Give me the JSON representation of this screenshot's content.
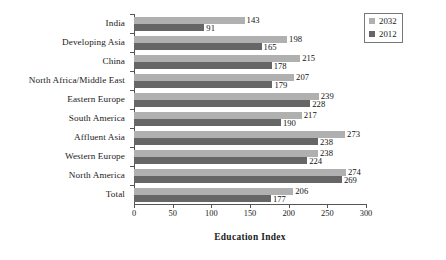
{
  "chart_data": {
    "type": "bar",
    "orientation": "horizontal",
    "title": "",
    "xlabel": "Education Index",
    "ylabel": "",
    "xlim": [
      0,
      300
    ],
    "xticks": [
      0,
      50,
      100,
      150,
      200,
      250,
      300
    ],
    "grid": false,
    "legend_position": "top-right",
    "categories": [
      "India",
      "Developing Asia",
      "China",
      "North Africa/Middle East",
      "Eastern Europe",
      "South America",
      "Affluent Asia",
      "Western Europe",
      "North America",
      "Total"
    ],
    "series": [
      {
        "name": "2032",
        "color": "#b0b0b0",
        "values": [
          143,
          198,
          215,
          207,
          239,
          217,
          273,
          238,
          274,
          206
        ]
      },
      {
        "name": "2012",
        "color": "#666666",
        "values": [
          91,
          165,
          178,
          179,
          228,
          190,
          238,
          224,
          269,
          177
        ]
      }
    ]
  },
  "legend": {
    "items": [
      {
        "label": "2032",
        "color": "#b0b0b0"
      },
      {
        "label": "2012",
        "color": "#666666"
      }
    ]
  }
}
